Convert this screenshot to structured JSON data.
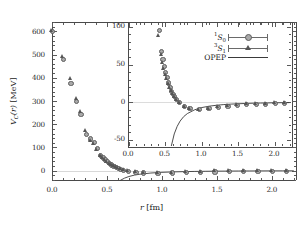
{
  "figure": {
    "main_axis": {
      "xlabel": "r [fm]",
      "ylabel_parts": {
        "v": "V",
        "c": "C",
        "r": "(r)",
        "unit": "[MeV]"
      },
      "ylabel_text": "V_C(r) [MeV]",
      "xticks": [
        "0.0",
        "0.5",
        "1.0",
        "1.5",
        "2.0"
      ],
      "yticks": [
        "0",
        "100",
        "200",
        "300",
        "400",
        "500",
        "600"
      ],
      "xlim": [
        0.0,
        2.22
      ],
      "ylim": [
        -40,
        640
      ]
    },
    "inset_axis": {
      "xticks": [
        "0.0",
        "0.5",
        "1.0",
        "1.5",
        "2.0"
      ],
      "yticks": [
        "-50",
        "0",
        "50",
        "100"
      ],
      "xlim": [
        0.0,
        2.22
      ],
      "ylim": [
        -58,
        105
      ]
    },
    "legend": {
      "entries": [
        {
          "label_sup": "1",
          "label_base": "S",
          "label_sub": "0",
          "marker": "circle"
        },
        {
          "label_sup": "3",
          "label_base": "S",
          "label_sub": "1",
          "marker": "triangle"
        },
        {
          "label_base": "OPEP",
          "marker": "line"
        }
      ]
    },
    "colors": {
      "circle_fill": "#a9a9a9",
      "circle_edge": "#5d5d5d",
      "triangle_fill": "#555555",
      "opep_line": "#3a3a3a",
      "axis": "#4a4a4a",
      "zeroline": "#d8d8d8"
    }
  },
  "chart_data": {
    "type": "scatter",
    "title": "",
    "xlabel": "r [fm]",
    "ylabel": "V_C(r) [MeV]",
    "xlim": [
      0.0,
      2.22
    ],
    "ylim": [
      -40,
      640
    ],
    "grid": false,
    "legend_position": "inset-top-right",
    "series": [
      {
        "name": "1S0",
        "marker": "circle",
        "x": [
          0.0,
          0.1,
          0.17,
          0.22,
          0.26,
          0.31,
          0.35,
          0.38,
          0.41,
          0.44,
          0.46,
          0.48,
          0.5,
          0.52,
          0.54,
          0.56,
          0.58,
          0.6,
          0.62,
          0.65,
          0.69,
          0.76,
          0.83,
          0.96,
          1.09,
          1.22,
          1.35,
          1.48,
          1.61,
          1.74,
          1.87,
          2.0,
          2.13
        ],
        "y": [
          600,
          480,
          378,
          300,
          245,
          158,
          138,
          122,
          96,
          68,
          57,
          48,
          40,
          33,
          26,
          20,
          15,
          11,
          8,
          4,
          0,
          -5,
          -8,
          -9,
          -8,
          -6,
          -5,
          -4,
          -3,
          -2,
          -2,
          -1,
          -1
        ]
      },
      {
        "name": "3S1",
        "marker": "triangle",
        "x": [
          0.0,
          0.1,
          0.17,
          0.22,
          0.26,
          0.31,
          0.35,
          0.38,
          0.41,
          0.44,
          0.46,
          0.48,
          0.5,
          0.52,
          0.54,
          0.56,
          0.58,
          0.6,
          0.62,
          0.65,
          0.69,
          0.76,
          0.83,
          0.96,
          1.09,
          1.22,
          1.35,
          1.48,
          1.61,
          1.74,
          1.87,
          2.0,
          2.13
        ],
        "y": [
          600,
          490,
          392,
          308,
          250,
          170,
          128,
          112,
          88,
          62,
          52,
          44,
          36,
          30,
          24,
          18,
          14,
          10,
          7,
          3,
          -1,
          -6,
          -9,
          -10,
          -9,
          -7,
          -5,
          -4,
          -3,
          -2,
          -2,
          -1,
          -1
        ]
      },
      {
        "name": "OPEP",
        "marker": "line",
        "x": [
          0.58,
          0.62,
          0.66,
          0.7,
          0.75,
          0.8,
          0.9,
          1.0,
          1.1,
          1.2,
          1.3,
          1.4,
          1.5,
          1.6,
          1.7,
          1.8,
          1.9,
          2.0,
          2.1,
          2.2
        ],
        "y": [
          -58,
          -42,
          -32,
          -25,
          -19,
          -15,
          -10,
          -7,
          -5.2,
          -4.0,
          -3.1,
          -2.5,
          -2.0,
          -1.6,
          -1.3,
          -1.1,
          -0.9,
          -0.7,
          -0.6,
          -0.5
        ]
      }
    ]
  }
}
